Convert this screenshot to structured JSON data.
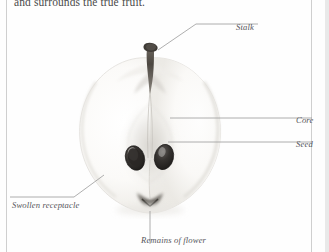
{
  "page": {
    "body_text": "and surrounds the true fruit.",
    "background_color": "#fefefe",
    "rule_color": "#cfcfcf",
    "leader_color": "#9a9a9a",
    "label_color": "#55555a"
  },
  "figure": {
    "labels": [
      {
        "id": "stalk",
        "text": "Stalk"
      },
      {
        "id": "core",
        "text": "Core"
      },
      {
        "id": "seed",
        "text": "Seed"
      },
      {
        "id": "receptacle",
        "text": "Swollen receptacle"
      },
      {
        "id": "flower",
        "text": "Remains of flower"
      }
    ],
    "colors": {
      "flesh_light": "#fdfdfc",
      "flesh_shade": "#eceae6",
      "core_shade": "#d7d4cf",
      "seed_dark": "#2f2d2b",
      "stalk_dark": "#4e4a45",
      "outline": "#d9d7d2"
    }
  }
}
